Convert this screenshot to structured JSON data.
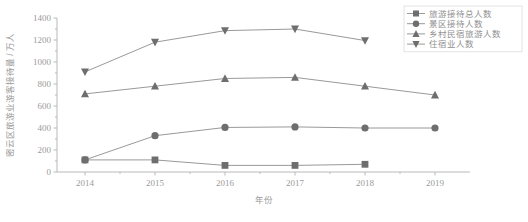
{
  "chart_data": {
    "type": "line",
    "title": "",
    "xlabel": "年份",
    "ylabel": "密云区旅游业游客接待量 / 万人",
    "categories": [
      "2014",
      "2015",
      "2016",
      "2017",
      "2018",
      "2019"
    ],
    "x": [
      2014,
      2015,
      2016,
      2017,
      2018,
      2019
    ],
    "xlim": [
      2013.6,
      2019.5
    ],
    "ylim": [
      0,
      1400
    ],
    "yticks": [
      0,
      200,
      400,
      600,
      800,
      1000,
      1200,
      1400
    ],
    "ytick_labels": [
      "0",
      "200",
      "400",
      "600",
      "800",
      "1000",
      "1200",
      "1400"
    ],
    "grid": false,
    "legend_position": "upper right",
    "series": [
      {
        "name": "旅游接待总人数",
        "marker": "square",
        "values": [
          110,
          110,
          60,
          60,
          70,
          null
        ]
      },
      {
        "name": "景区接待人数",
        "marker": "circle",
        "values": [
          110,
          330,
          405,
          410,
          400,
          400
        ]
      },
      {
        "name": "乡村民宿旅游人数",
        "marker": "triangle-up",
        "values": [
          710,
          780,
          850,
          860,
          780,
          700
        ]
      },
      {
        "name": "住宿业人数",
        "marker": "triangle-down",
        "values": [
          910,
          1180,
          1285,
          1300,
          1195,
          null
        ]
      }
    ]
  },
  "legend": {
    "entries": [
      {
        "label": "旅游接待总人数",
        "marker": "square"
      },
      {
        "label": "景区接待人数",
        "marker": "circle"
      },
      {
        "label": "乡村民宿旅游人数",
        "marker": "triangle-up"
      },
      {
        "label": "住宿业人数",
        "marker": "triangle-down"
      }
    ]
  },
  "colors": {
    "marker": "#6e6e6e",
    "line": "#8d8d8d",
    "axis": "#b9b9b9",
    "text": "#9a9a9a",
    "background": "#ffffff"
  }
}
